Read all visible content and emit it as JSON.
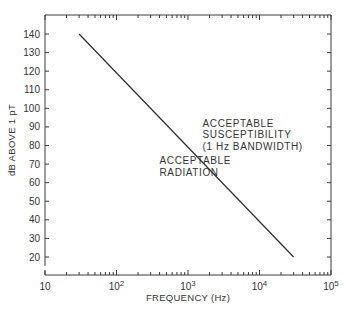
{
  "chart_data": {
    "type": "line",
    "title": "",
    "xlabel": "FREQUENCY (Hz)",
    "ylabel": "dB ABOVE 1 pT",
    "xscale": "log",
    "xlim": [
      10,
      100000
    ],
    "ylim": [
      15,
      150
    ],
    "grid": false,
    "x_ticks": [
      {
        "value": 10,
        "base": "10",
        "exp": ""
      },
      {
        "value": 100,
        "base": "10",
        "exp": "2"
      },
      {
        "value": 1000,
        "base": "10",
        "exp": "3"
      },
      {
        "value": 10000,
        "base": "10",
        "exp": "4"
      },
      {
        "value": 100000,
        "base": "10",
        "exp": "5"
      }
    ],
    "y_ticks": [
      20,
      30,
      40,
      50,
      60,
      70,
      80,
      90,
      100,
      110,
      120,
      130,
      140
    ],
    "series": [
      {
        "name": "limit",
        "x": [
          30,
          30000
        ],
        "y": [
          140,
          20
        ]
      }
    ],
    "annotations": [
      {
        "lines": [
          "ACCEPTABLE",
          "RADIATION"
        ],
        "x": 400,
        "y": 70
      },
      {
        "lines": [
          "ACCEPTABLE",
          "SUSCEPTIBILITY",
          "(1 Hz BANDWIDTH)"
        ],
        "x": 1600,
        "y": 90
      }
    ]
  }
}
